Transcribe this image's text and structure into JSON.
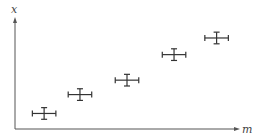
{
  "chart_data": {
    "type": "scatter",
    "title": "",
    "xlabel": "m",
    "ylabel": "x",
    "xlim": [
      0,
      10
    ],
    "ylim": [
      0,
      10
    ],
    "ticks": false,
    "grid": false,
    "legend": null,
    "error_bars": true,
    "series": [
      {
        "name": "measurements",
        "points": [
          {
            "x": 1.3,
            "y": 1.4,
            "xerr": 0.7,
            "yerr": 0.7
          },
          {
            "x": 2.9,
            "y": 3.1,
            "xerr": 0.7,
            "yerr": 0.7
          },
          {
            "x": 5.0,
            "y": 4.4,
            "xerr": 0.7,
            "yerr": 0.7
          },
          {
            "x": 7.1,
            "y": 6.7,
            "xerr": 0.7,
            "yerr": 0.7
          },
          {
            "x": 9.0,
            "y": 8.2,
            "xerr": 0.7,
            "yerr": 0.7
          }
        ]
      }
    ]
  },
  "colors": {
    "axis": "#555555",
    "marker": "#333333",
    "label": "#444444"
  }
}
